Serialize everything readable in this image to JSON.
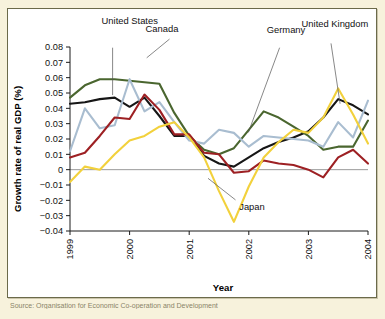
{
  "figure": {
    "background_color": "#f7f2dc",
    "panel_color": "#ffffff",
    "border_color": "#6b6a4a"
  },
  "chart_data": {
    "type": "line",
    "title": "",
    "xlabel": "Year",
    "ylabel": "Growth rate of real GDP (%)",
    "xlim": [
      1999.0,
      2004.0
    ],
    "ylim": [
      -0.04,
      0.08
    ],
    "ytick_labels": [
      "0.08",
      "0.07",
      "0.06",
      "0.05",
      "0.04",
      "0.03",
      "0.02",
      "0.01",
      "0",
      "−0.01",
      "−0.02",
      "−0.03",
      "−0.04"
    ],
    "ytick_values": [
      0.08,
      0.07,
      0.06,
      0.05,
      0.04,
      0.03,
      0.02,
      0.01,
      0,
      -0.01,
      -0.02,
      -0.03,
      -0.04
    ],
    "xtick_labels": [
      "1999",
      "2000",
      "2001",
      "2002",
      "2003",
      "2004"
    ],
    "xtick_values": [
      1999,
      2000,
      2001,
      2002,
      2003,
      2004
    ],
    "grid": false,
    "zero_line": true,
    "legend_position": "inline-annotations",
    "x": [
      1999.0,
      1999.25,
      1999.5,
      1999.75,
      2000.0,
      2000.25,
      2000.5,
      2000.75,
      2001.0,
      2001.25,
      2001.5,
      2001.75,
      2002.0,
      2002.25,
      2002.5,
      2002.75,
      2003.0,
      2003.25,
      2003.5,
      2003.75,
      2004.0
    ],
    "series": [
      {
        "name": "United States",
        "color": "#161616",
        "values": [
          0.043,
          0.044,
          0.046,
          0.047,
          0.041,
          0.047,
          0.035,
          0.022,
          0.022,
          0.009,
          0.004,
          0.002,
          0.008,
          0.014,
          0.018,
          0.021,
          0.025,
          0.034,
          0.046,
          0.042,
          0.036
        ]
      },
      {
        "name": "Canada",
        "color": "#4a662f",
        "values": [
          0.047,
          0.055,
          0.059,
          0.059,
          0.058,
          0.057,
          0.056,
          0.037,
          0.022,
          0.013,
          0.01,
          0.014,
          0.026,
          0.038,
          0.034,
          0.028,
          0.022,
          0.013,
          0.015,
          0.015,
          0.032
        ]
      },
      {
        "name": "United Kingdom",
        "color": "#a9bdd0",
        "values": [
          0.012,
          0.04,
          0.027,
          0.029,
          0.059,
          0.038,
          0.044,
          0.031,
          0.019,
          0.017,
          0.026,
          0.024,
          0.015,
          0.022,
          0.021,
          0.02,
          0.019,
          0.015,
          0.031,
          0.021,
          0.045
        ]
      },
      {
        "name": "Germany",
        "color": "#9d2023",
        "values": [
          0.008,
          0.011,
          0.022,
          0.034,
          0.033,
          0.049,
          0.039,
          0.023,
          0.023,
          0.011,
          0.01,
          -0.002,
          -0.001,
          0.006,
          0.004,
          0.003,
          0.0,
          -0.005,
          0.008,
          0.013,
          0.004
        ]
      },
      {
        "name": "Japan",
        "color": "#f2d13c",
        "values": [
          -0.008,
          0.002,
          0.0,
          0.01,
          0.019,
          0.022,
          0.028,
          0.031,
          0.021,
          0.008,
          -0.014,
          -0.034,
          -0.011,
          0.008,
          0.018,
          0.026,
          0.024,
          0.034,
          0.053,
          0.036,
          0.017
        ]
      }
    ],
    "annotations": [
      {
        "label": "United States",
        "x": 0.255,
        "y": 0.052
      },
      {
        "label": "Canada",
        "x": 0.375,
        "y": 0.08
      },
      {
        "label": "Germany",
        "x": 0.705,
        "y": 0.085
      },
      {
        "label": "United Kingdom",
        "x": 0.8,
        "y": 0.063
      },
      {
        "label": "Japan",
        "x": 0.63,
        "y": 0.7
      }
    ]
  },
  "caption": {
    "text": "Source: Organisation for Economic Co-operation and Development"
  }
}
